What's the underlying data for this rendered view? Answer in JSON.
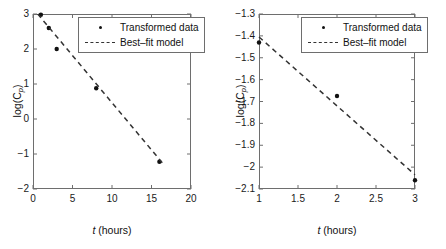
{
  "figure": {
    "panel_count": 2
  },
  "legend": {
    "data_label": "Transformed data",
    "model_label": "Best–fit model",
    "marker_icon": "filled-circle-marker",
    "line_icon": "dashed-line-swatch"
  },
  "left_panel": {
    "xlabel_var": "t",
    "xlabel_unit": " (hours)",
    "ylabel_prefix": "log(C",
    "ylabel_sub": "p",
    "ylabel_suffix": ")",
    "xticks": [
      "0",
      "5",
      "10",
      "15",
      "20"
    ],
    "yticks": [
      "3",
      "2",
      "1",
      "0",
      "−1",
      "−2"
    ]
  },
  "right_panel": {
    "xlabel_var": "t",
    "xlabel_unit": " (hours)",
    "ylabel_prefix": "log(C",
    "ylabel_sub": "p",
    "ylabel_suffix": ")",
    "xticks": [
      "1",
      "1.5",
      "2",
      "2.5",
      "3"
    ],
    "yticks": [
      "−1.3",
      "−1.4",
      "−1.5",
      "−1.6",
      "−1.7",
      "−1.8",
      "−1.9",
      "−2",
      "−2.1"
    ]
  },
  "chart_data": [
    {
      "type": "scatter",
      "title": "",
      "xlabel": "t (hours)",
      "ylabel": "log(Cp)",
      "xlim": [
        0,
        20
      ],
      "ylim": [
        -2,
        3
      ],
      "xticks": [
        0,
        5,
        10,
        15,
        20
      ],
      "yticks": [
        3,
        2,
        1,
        0,
        -1,
        -2
      ],
      "grid": false,
      "legend_position": "top-right",
      "series": [
        {
          "name": "Transformed data",
          "type": "scatter",
          "marker": "filled-circle",
          "color": "#111111",
          "x": [
            1,
            2,
            3,
            8,
            16
          ],
          "y": [
            2.98,
            2.6,
            2.0,
            0.88,
            -1.22
          ]
        },
        {
          "name": "Best-fit model",
          "type": "line",
          "style": "dashed",
          "color": "#333333",
          "x": [
            0.6,
            16.4
          ],
          "y": [
            3.0,
            -1.26
          ],
          "slope": -0.2696,
          "intercept": 3.16
        }
      ]
    },
    {
      "type": "scatter",
      "title": "",
      "xlabel": "t (hours)",
      "ylabel": "log(Cp)",
      "xlim": [
        1,
        3
      ],
      "ylim": [
        -2.1,
        -1.3
      ],
      "xticks": [
        1,
        1.5,
        2,
        2.5,
        3
      ],
      "yticks": [
        -1.3,
        -1.4,
        -1.5,
        -1.6,
        -1.7,
        -1.8,
        -1.9,
        -2,
        -2.1
      ],
      "grid": false,
      "legend_position": "top-right",
      "series": [
        {
          "name": "Transformed data",
          "type": "scatter",
          "marker": "filled-circle",
          "color": "#111111",
          "x": [
            1,
            2,
            3
          ],
          "y": [
            -1.43,
            -1.675,
            -2.06
          ]
        },
        {
          "name": "Best-fit model",
          "type": "line",
          "style": "dashed",
          "color": "#333333",
          "x": [
            1,
            3
          ],
          "y": [
            -1.405,
            -2.035
          ],
          "slope": -0.315,
          "intercept": -1.09
        }
      ]
    }
  ]
}
